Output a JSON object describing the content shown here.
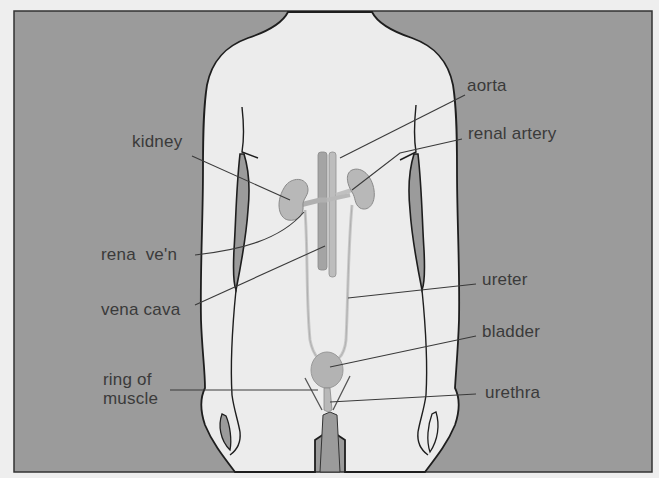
{
  "diagram": {
    "colors": {
      "page_background": "#eeeeee",
      "frame_background": "#9b9b9b",
      "body_fill": "#ececec",
      "outline": "#1e1e1e",
      "organ_fill": "#b8b8b8",
      "vessel_fill": "#a4a4a4",
      "leader_line": "#3a3a3a",
      "label_text": "#3a3a3a"
    },
    "labels": {
      "aorta": "aorta",
      "renal_artery": "renal artery",
      "kidney": "kidney",
      "renal_vein": "rena  ve'n",
      "vena_cava": "vena cava",
      "ureter": "ureter",
      "bladder": "bladder",
      "ring_of_muscle": "ring of\nmuscle",
      "urethra": "urethra"
    }
  }
}
